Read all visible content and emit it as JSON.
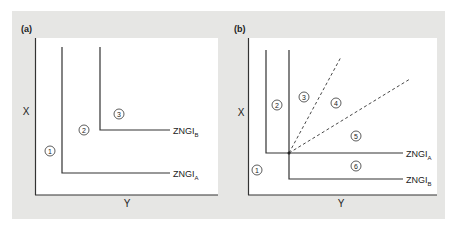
{
  "figure": {
    "panels": [
      {
        "id": "a",
        "label": "(a)",
        "x_axis_label": "Y",
        "y_axis_label": "X",
        "lines": [
          {
            "name": "ZNGI",
            "subscript": "A"
          },
          {
            "name": "ZNGI",
            "subscript": "B"
          }
        ],
        "regions": [
          "1",
          "2",
          "3"
        ]
      },
      {
        "id": "b",
        "label": "(b)",
        "x_axis_label": "Y",
        "y_axis_label": "X",
        "lines": [
          {
            "name": "ZNGI",
            "subscript": "A"
          },
          {
            "name": "ZNGI",
            "subscript": "B"
          }
        ],
        "regions": [
          "1",
          "2",
          "3",
          "4",
          "5",
          "6"
        ]
      }
    ],
    "colors": {
      "background_panel": "#e6e6e4",
      "plot_area": "#ffffff",
      "lines": "#333333"
    }
  }
}
